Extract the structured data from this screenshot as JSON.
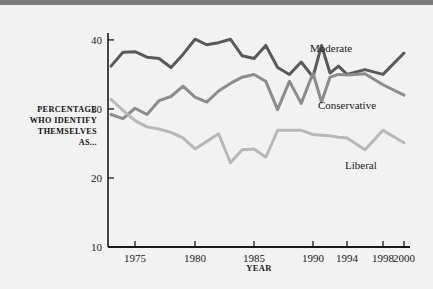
{
  "figure": {
    "background_color": "#f2f2f2",
    "top_band_color": "#7d7d7d",
    "axis_color": "#1a1a1a"
  },
  "chart_data": {
    "type": "line",
    "title": "",
    "xlabel": "YEAR",
    "ylabel": "PERCENTAGE WHO IDENTIFY THEMSELVES AS...",
    "ylabel_lines": [
      "PERCENTAGE",
      "WHO IDENTIFY",
      "THEMSELVES",
      "AS..."
    ],
    "xlim": [
      1973,
      2000
    ],
    "ylim": [
      10,
      41
    ],
    "grid": false,
    "legend_position": "inline-right",
    "xticks": [
      1975,
      1980,
      1985,
      1990,
      1994,
      1998,
      2000
    ],
    "xtick_labels": [
      "1975",
      "1980",
      "1985",
      "1990",
      "1994",
      "1998",
      "2000"
    ],
    "yticks": [
      10,
      20,
      30,
      40
    ],
    "ytick_labels": [
      "10",
      "20",
      "30",
      "40"
    ],
    "x": [
      1973,
      1974,
      1975,
      1976,
      1977,
      1978,
      1979,
      1980,
      1981,
      1982,
      1983,
      1984,
      1985,
      1986,
      1987,
      1988,
      1989,
      1990,
      1991,
      1992,
      1993,
      1994,
      1996,
      1998,
      2000
    ],
    "series": [
      {
        "name": "Moderate",
        "color": "#595959",
        "label_color": "#1a1a1a",
        "values": [
          36.2,
          38.2,
          38.3,
          37.5,
          37.3,
          36.0,
          37.9,
          40.1,
          39.3,
          39.6,
          40.1,
          37.7,
          37.3,
          39.2,
          36.0,
          35.0,
          36.8,
          34.6,
          39.2,
          35.2,
          36.2,
          35.0,
          35.7,
          35.0,
          38.1
        ]
      },
      {
        "name": "Conservative",
        "color": "#8c8c8c",
        "label_color": "#1a1a1a",
        "values": [
          29.2,
          28.6,
          30.1,
          29.2,
          31.2,
          31.8,
          33.3,
          31.7,
          31.0,
          32.6,
          33.7,
          34.6,
          35.0,
          34.0,
          29.9,
          34.0,
          30.8,
          35.2,
          31.0,
          34.6,
          35.0,
          34.9,
          35.1,
          33.5,
          32.0
        ]
      },
      {
        "name": "Liberal",
        "color": "#b8b8b8",
        "label_color": "#1a1a1a",
        "values": [
          31.4,
          29.8,
          28.3,
          27.4,
          27.1,
          26.6,
          25.8,
          24.2,
          25.3,
          26.4,
          22.2,
          24.1,
          24.2,
          23.0,
          26.9,
          26.9,
          26.9,
          26.3,
          26.2,
          26.1,
          25.9,
          25.8,
          24.1,
          26.9,
          25.1
        ]
      }
    ]
  }
}
